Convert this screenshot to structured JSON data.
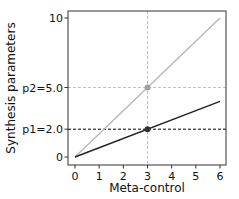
{
  "chart_data": {
    "type": "line",
    "title": "",
    "xlabel": "Meta-control",
    "ylabel": "Synthesis parameters",
    "xlim": [
      -0.3,
      6.3
    ],
    "ylim": [
      -0.5,
      10.5
    ],
    "x_ticks": [
      0,
      1,
      2,
      3,
      4,
      5,
      6
    ],
    "x_tick_labels": [
      "0",
      "1",
      "2",
      "3",
      "4",
      "5",
      "6"
    ],
    "y_ticks": [
      0,
      2,
      5,
      10
    ],
    "y_tick_labels": [
      "0",
      "p1=2.0",
      "p2=5.0",
      "10"
    ],
    "grid": false,
    "series": [
      {
        "name": "p2",
        "color": "#b3b3b3",
        "x": [
          0,
          6
        ],
        "y": [
          0,
          10
        ]
      },
      {
        "name": "p1",
        "color": "#222222",
        "x": [
          0,
          6
        ],
        "y": [
          0,
          4
        ]
      }
    ],
    "markers": [
      {
        "x": 3,
        "y": 5.0,
        "color": "#a0a0a0"
      },
      {
        "x": 3,
        "y": 2.0,
        "color": "#333333"
      }
    ],
    "reference_lines": [
      {
        "orientation": "vertical",
        "x": 3,
        "style": "dashed",
        "color": "#c0c0c0"
      },
      {
        "orientation": "horizontal",
        "y": 5.0,
        "style": "dashed",
        "color": "#c0c0c0"
      },
      {
        "orientation": "horizontal",
        "y": 2.0,
        "style": "dashed",
        "color": "#000000"
      }
    ]
  }
}
